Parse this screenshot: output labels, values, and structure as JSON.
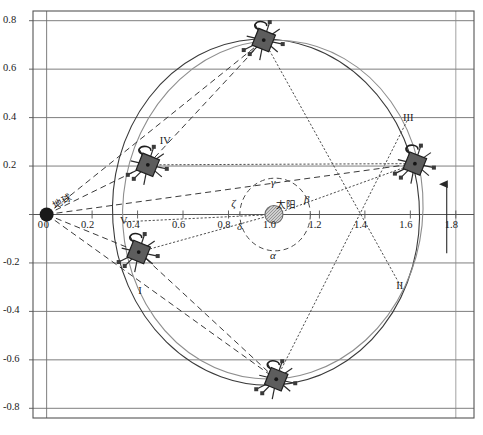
{
  "figure": {
    "kind": "orbit-transfer-diagram",
    "background": "#ffffff",
    "frame_color": "#555555",
    "grid_color": "#6f6f6f"
  },
  "chart_data": {
    "type": "scatter",
    "title": "",
    "xlabel": "",
    "ylabel": "",
    "xlim": [
      -0.06,
      1.88
    ],
    "ylim": [
      -0.84,
      0.84
    ],
    "grid": true,
    "grid_axis": "y",
    "legend_position": "none",
    "xticks": [
      "0",
      "0.2",
      "0.4",
      "0.6",
      "0.8",
      "1.0",
      "1.2",
      "1.4",
      "1.6",
      "1.8"
    ],
    "xtick_values": [
      0,
      0.2,
      0.4,
      0.6,
      0.8,
      1.0,
      1.2,
      1.4,
      1.6,
      1.8
    ],
    "yticks": [
      "0.8",
      "0.6",
      "0.4",
      "0.2",
      "0",
      "-0.2",
      "-0.4",
      "-0.6",
      "-0.8"
    ],
    "ytick_values": [
      0.8,
      0.6,
      0.4,
      0.2,
      0,
      -0.2,
      -0.4,
      -0.6,
      -0.8
    ],
    "bodies": [
      {
        "name": "earth",
        "label": "地球",
        "x": 0.0,
        "y": 0.0,
        "marker": "filled-circle",
        "color": "#1a1a1a",
        "radius_px": 7
      },
      {
        "name": "sun",
        "label": "太阳",
        "x": 1.0,
        "y": 0.0,
        "marker": "hatched-circle",
        "color": "#8a8a8a",
        "radius_px": 9
      }
    ],
    "spacecraft": [
      {
        "id": "sc-upper-left",
        "x": 0.445,
        "y": 0.205,
        "tag": "C"
      },
      {
        "id": "sc-top",
        "x": 0.955,
        "y": 0.72,
        "tag": "C"
      },
      {
        "id": "sc-right",
        "x": 1.62,
        "y": 0.21,
        "tag": "C"
      },
      {
        "id": "sc-lower-left",
        "x": 0.405,
        "y": -0.155,
        "tag": "C"
      },
      {
        "id": "sc-bottom",
        "x": 1.01,
        "y": -0.68,
        "tag": "C"
      }
    ],
    "point_labels": [
      {
        "text": "I",
        "x": 0.425,
        "y": -0.32
      },
      {
        "text": "II",
        "x": 1.56,
        "y": -0.3
      },
      {
        "text": "III",
        "x": 1.59,
        "y": 0.395
      },
      {
        "text": "IV",
        "x": 0.52,
        "y": 0.3
      },
      {
        "text": "V",
        "x": 0.345,
        "y": -0.03
      }
    ],
    "angle_labels": [
      {
        "text": "α",
        "x": 1.0,
        "y": -0.175
      },
      {
        "text": "β",
        "x": 1.15,
        "y": 0.055
      },
      {
        "text": "γ",
        "x": 1.005,
        "y": 0.125
      },
      {
        "text": "δ",
        "x": 0.855,
        "y": -0.055
      },
      {
        "text": "ζ",
        "x": 0.83,
        "y": 0.04
      }
    ],
    "orbits": [
      {
        "name": "outer-orbit-solid",
        "type": "ellipse",
        "cx": 0.965,
        "cy": 0.01,
        "rx": 0.675,
        "ry": 0.715,
        "rotation_deg": -4,
        "style": "solid",
        "color": "#3a3a3a"
      },
      {
        "name": "outer-orbit-light",
        "type": "ellipse",
        "cx": 0.995,
        "cy": 0.02,
        "rx": 0.66,
        "ry": 0.7,
        "rotation_deg": 6,
        "style": "solid",
        "color": "#8e8e8e"
      },
      {
        "name": "inner-orbit-dashed",
        "type": "ellipse",
        "cx": 1.005,
        "cy": 0.0,
        "rx": 0.155,
        "ry": 0.15,
        "rotation_deg": 0,
        "style": "dashed",
        "color": "#4a4a4a"
      }
    ],
    "sight_lines_dashed": [
      {
        "from": [
          0.0,
          0.0
        ],
        "to": [
          0.445,
          0.205
        ]
      },
      {
        "from": [
          0.0,
          0.0
        ],
        "to": [
          0.405,
          -0.155
        ]
      },
      {
        "from": [
          0.0,
          0.0
        ],
        "to": [
          1.62,
          0.21
        ]
      },
      {
        "from": [
          0.0,
          0.0
        ],
        "to": [
          1.01,
          -0.68
        ]
      },
      {
        "from": [
          0.0,
          0.0
        ],
        "to": [
          0.955,
          0.72
        ]
      },
      {
        "from": [
          0.445,
          0.205
        ],
        "to": [
          0.955,
          0.72
        ]
      },
      {
        "from": [
          0.405,
          -0.155
        ],
        "to": [
          1.01,
          -0.68
        ]
      }
    ],
    "sight_lines_dotted": [
      {
        "from": [
          0.445,
          0.205
        ],
        "to": [
          1.62,
          0.21
        ]
      },
      {
        "from": [
          0.405,
          -0.155
        ],
        "to": [
          1.0,
          0.0
        ]
      },
      {
        "from": [
          0.955,
          0.72
        ],
        "to": [
          1.56,
          -0.3
        ]
      },
      {
        "from": [
          1.01,
          -0.68
        ],
        "to": [
          1.59,
          0.395
        ]
      },
      {
        "from": [
          0.345,
          -0.03
        ],
        "to": [
          1.0,
          0.0
        ]
      },
      {
        "from": [
          1.0,
          0.0
        ],
        "to": [
          1.62,
          0.21
        ]
      }
    ],
    "direction_arrow": {
      "name": "orbit-direction-arrow",
      "x": 1.76,
      "y_from": -0.16,
      "y_to": 0.125,
      "points": "up"
    }
  }
}
